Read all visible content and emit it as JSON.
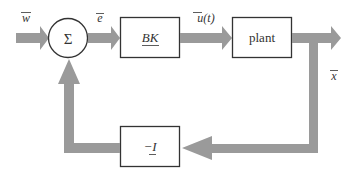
{
  "diagram": {
    "type": "block-diagram",
    "colors": {
      "arrow": "#9a9a9a",
      "stroke": "#333333",
      "text": "#333333",
      "background": "#ffffff"
    },
    "signals": {
      "input": "w",
      "error": "e",
      "control": "u(t)",
      "output": "x"
    },
    "summing_junction": {
      "symbol": "Σ"
    },
    "blocks": {
      "controller": "BK",
      "plant": "plant",
      "feedback": "−I"
    },
    "feedback_gain_prefix": "−",
    "feedback_gain_symbol": "I",
    "connections": [
      {
        "from": "input",
        "to": "summing_junction",
        "label": "w"
      },
      {
        "from": "summing_junction",
        "to": "controller",
        "label": "e"
      },
      {
        "from": "controller",
        "to": "plant",
        "label": "u(t)"
      },
      {
        "from": "plant",
        "to": "output",
        "label": "x"
      },
      {
        "from": "output",
        "to": "feedback"
      },
      {
        "from": "feedback",
        "to": "summing_junction"
      }
    ]
  }
}
